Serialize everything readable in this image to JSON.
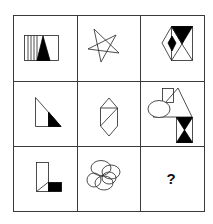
{
  "puzzle": {
    "title": "3x3 figure reasoning matrix",
    "rows": 3,
    "cols": 3,
    "line_color": "#333333",
    "fill_color": "#000000",
    "cells": [
      {
        "row": 1,
        "col": 1,
        "name": "rectangle-with-vertical-lines-and-black-triangle"
      },
      {
        "row": 1,
        "col": 2,
        "name": "five-pointed-star-outline"
      },
      {
        "row": 1,
        "col": 3,
        "name": "rectangle-hexagon-with-black-triangle-and-black-diamond"
      },
      {
        "row": 2,
        "col": 1,
        "name": "right-triangle-with-black-corner"
      },
      {
        "row": 2,
        "col": 2,
        "name": "elongated-hexagon-with-diagonals"
      },
      {
        "row": 2,
        "col": 3,
        "name": "ellipse-square-triangle-hourglass-cluster"
      },
      {
        "row": 3,
        "col": 1,
        "name": "l-shape-with-black-square"
      },
      {
        "row": 3,
        "col": 2,
        "name": "five-overlapping-ellipses"
      },
      {
        "row": 3,
        "col": 3,
        "name": "answer-placeholder",
        "label": "?"
      }
    ]
  }
}
